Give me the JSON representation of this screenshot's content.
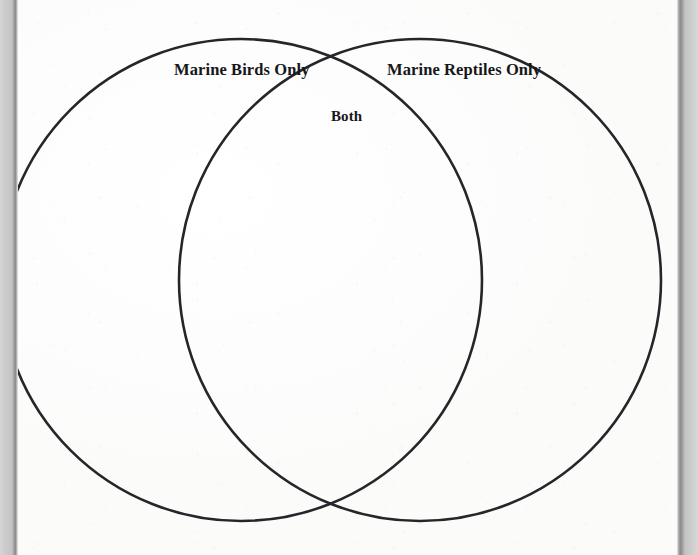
{
  "document": {
    "type": "venn-diagram-worksheet",
    "background_color": "#fdfdfd",
    "stroke_color": "#26262a",
    "text_color": "#17171a"
  },
  "scan_edges": {
    "left_band_color": "#c9c9c9",
    "left_spine_color": "#8e8e8e",
    "right_band_color": "#cbcbcb",
    "right_spine_color": "#8b8b8b"
  },
  "diagram": {
    "title": "",
    "circles": [
      {
        "id": "left-circle",
        "name": "marine-birds-circle",
        "cx": 241,
        "cy": 280,
        "r": 241,
        "stroke": "#26262a",
        "stroke_width": 2.6,
        "fill": "none"
      },
      {
        "id": "right-circle",
        "name": "marine-reptiles-circle",
        "cx": 420,
        "cy": 280,
        "r": 241,
        "stroke": "#26262a",
        "stroke_width": 2.6,
        "fill": "none"
      }
    ],
    "labels": {
      "left": "Marine Birds Only",
      "right": "Marine Reptiles Only",
      "intersection": "Both"
    }
  }
}
